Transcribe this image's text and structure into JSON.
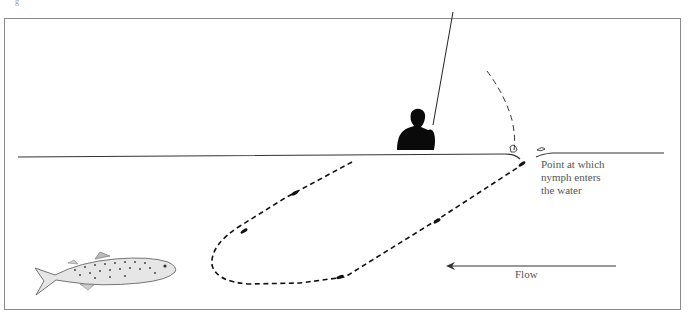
{
  "figure": {
    "corner_mark": "g",
    "labels": {
      "entry_point": [
        "Point at which",
        "nymph enters",
        "the water"
      ],
      "flow": "Flow"
    },
    "elements": {
      "angler": "angler-silhouette",
      "rod": "fly-rod",
      "cast_line": "dashed-cast-arc",
      "drift_path": "dashed-u-drift-path",
      "fish": "brown-trout",
      "water_surface": "water-surface-line",
      "flow_arrow": "flow-arrow-left"
    },
    "colors": {
      "ink": "#111111",
      "frame": "#777777",
      "text": "#555555"
    }
  }
}
